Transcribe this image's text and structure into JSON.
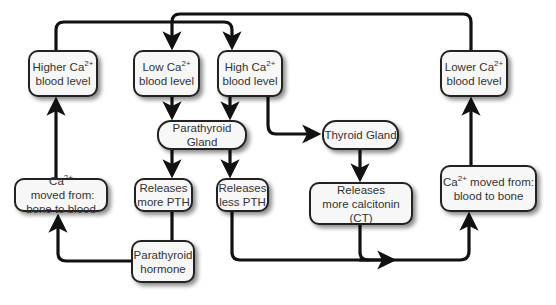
{
  "diagram": {
    "type": "flowchart",
    "topic": "Calcium homeostasis feedback loop",
    "nodes": {
      "higher_ca": {
        "line1": "Higher Ca",
        "sup": "2+",
        "line2": "blood level"
      },
      "low_ca": {
        "line1": "Low Ca",
        "sup": "2+",
        "line2": "blood level"
      },
      "high_ca": {
        "line1": "High Ca",
        "sup": "2+",
        "line2": "blood level"
      },
      "lower_ca": {
        "line1": "Lower Ca",
        "sup": "2+",
        "line2": "blood level"
      },
      "parathyroid_gland": {
        "label": "Parathyroid Gland"
      },
      "thyroid_gland": {
        "label": "Thyroid Gland"
      },
      "bone_to_blood": {
        "line1_pre": "Ca",
        "sup": "2+",
        "line1_post": " moved from:",
        "line2": "bone to blood"
      },
      "more_pth": {
        "line1": "Releases",
        "line2": "more PTH"
      },
      "less_pth": {
        "line1": "Releases",
        "line2": "less PTH"
      },
      "more_ct": {
        "line1": "Releases",
        "line2": "more calcitonin (CT)"
      },
      "blood_to_bone": {
        "line1_pre": "Ca",
        "sup": "2+",
        "line1_post": " moved from:",
        "line2": "blood to bone"
      },
      "pth_hormone": {
        "line1": "Parathyroid",
        "line2": "hormone"
      }
    },
    "edges": [
      {
        "from": "higher_ca",
        "to": "high_ca"
      },
      {
        "from": "lower_ca",
        "to": "low_ca"
      },
      {
        "from": "low_ca",
        "to": "parathyroid_gland"
      },
      {
        "from": "high_ca",
        "to": "parathyroid_gland"
      },
      {
        "from": "high_ca",
        "to": "thyroid_gland"
      },
      {
        "from": "parathyroid_gland",
        "to": "more_pth"
      },
      {
        "from": "parathyroid_gland",
        "to": "less_pth"
      },
      {
        "from": "thyroid_gland",
        "to": "more_ct"
      },
      {
        "from": "more_pth",
        "to": "pth_hormone"
      },
      {
        "from": "pth_hormone",
        "to": "bone_to_blood"
      },
      {
        "from": "bone_to_blood",
        "to": "higher_ca"
      },
      {
        "from": "less_pth",
        "to": "blood_to_bone"
      },
      {
        "from": "more_ct",
        "to": "blood_to_bone"
      },
      {
        "from": "blood_to_bone",
        "to": "lower_ca"
      }
    ],
    "colors": {
      "line": "#111111",
      "box_fill": "#f7f7f7",
      "box_border": "#222222",
      "text": "#333333"
    }
  }
}
